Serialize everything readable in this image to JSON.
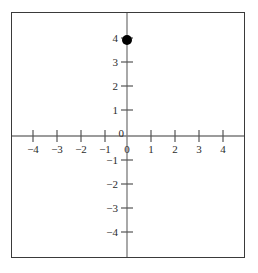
{
  "figure": {
    "title": "",
    "background_color": "#ffffff",
    "frame_color": "#3a3a3a",
    "axis_color": "#7a7a7a",
    "tick_color": "#555555",
    "label_color": "#2b2b2b",
    "point_color": "#000000"
  },
  "chart_data": {
    "type": "scatter",
    "title": "",
    "xlabel": "",
    "ylabel": "",
    "xlim": [
      -4.8,
      4.8
    ],
    "ylim": [
      -4.9,
      4.9
    ],
    "grid": false,
    "legend": "none",
    "x_ticks": [
      -4,
      -3,
      -2,
      -1,
      0,
      1,
      2,
      3,
      4
    ],
    "y_ticks": [
      -4,
      -3,
      -2,
      -1,
      0,
      1,
      2,
      3,
      4
    ],
    "x_tick_labels": [
      "−4",
      "−3",
      "−2",
      "−1",
      "0",
      "1",
      "2",
      "3",
      "4"
    ],
    "y_tick_labels": [
      "−4",
      "−3",
      "−2",
      "−1",
      "0",
      "1",
      "2",
      "3",
      "4"
    ],
    "series": [
      {
        "name": "point",
        "marker": "filled-circle",
        "points": [
          {
            "x": 0,
            "y": 4,
            "label": "(0, 4)"
          }
        ]
      }
    ]
  },
  "accessibility": {
    "description": "Cartesian coordinate plane with x and y axes from -4 to 4 and a single filled point plotted at (0, 4) on the y-axis."
  }
}
